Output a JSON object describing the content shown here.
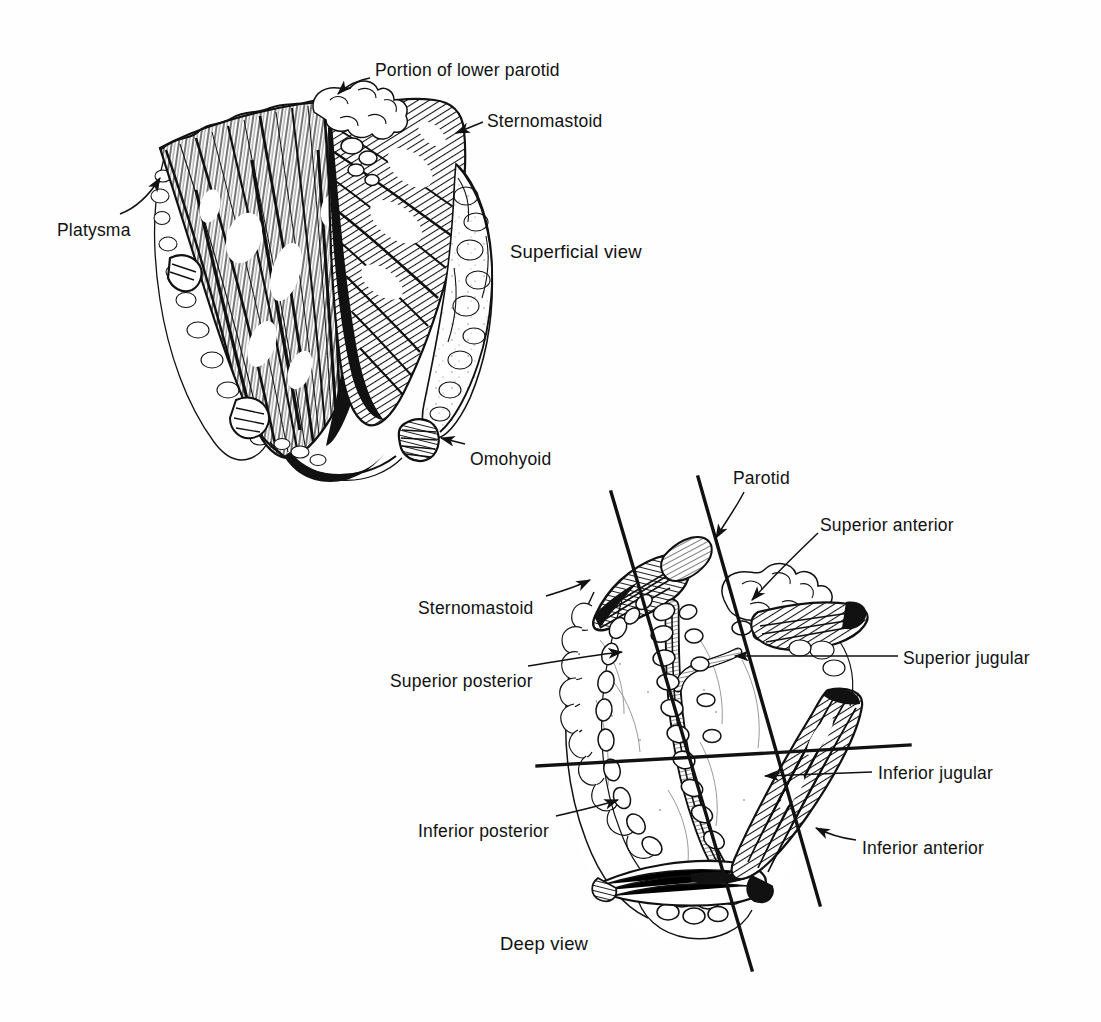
{
  "plate": {
    "background_color": "#ffffff",
    "ink_color": "#111111",
    "width": 1101,
    "height": 1022,
    "medium": "pen-and-ink line engraving",
    "subject": "Neck dissection: superficial and deep views with cervical lymph node groups"
  },
  "figures": [
    {
      "id": "superficial",
      "caption": "Superficial view",
      "caption_pos": {
        "x": 510,
        "y": 243
      },
      "labels": [
        {
          "id": "portion-of-lower-parotid",
          "text": "Portion of lower parotid",
          "x": 375,
          "y": 62,
          "leader": {
            "from": [
              370,
              78
            ],
            "to": [
              336,
              95
            ],
            "arrow": true,
            "curve": "concave-down"
          }
        },
        {
          "id": "sternomastoid-superficial",
          "text": "Sternomastoid",
          "x": 487,
          "y": 113,
          "leader": {
            "from": [
              482,
              124
            ],
            "to": [
              452,
              135
            ],
            "arrow": true,
            "curve": "straight"
          }
        },
        {
          "id": "platysma",
          "text": "Platysma",
          "x": 57,
          "y": 222,
          "leader": {
            "from": [
              118,
              214
            ],
            "to": [
              160,
              176
            ],
            "arrow": true,
            "curve": "concave-left"
          }
        },
        {
          "id": "omohyoid-superficial",
          "text": "Omohyoid",
          "x": 470,
          "y": 451,
          "leader": {
            "from": [
              463,
              444
            ],
            "to": [
              437,
              437
            ],
            "arrow": true,
            "curve": "straight"
          }
        }
      ]
    },
    {
      "id": "deep",
      "caption": "Deep view",
      "caption_pos": {
        "x": 500,
        "y": 935
      },
      "labels": [
        {
          "id": "parotid",
          "text": "Parotid",
          "x": 733,
          "y": 470,
          "leader": {
            "from": [
              740,
              488
            ],
            "to": [
              713,
              540
            ],
            "arrow": true,
            "curve": "concave-right"
          }
        },
        {
          "id": "superior-anterior",
          "text": "Superior anterior",
          "x": 820,
          "y": 517,
          "leader": {
            "from": [
              818,
              533
            ],
            "to": [
              748,
              604
            ],
            "arrow": true,
            "curve": "concave-up"
          }
        },
        {
          "id": "sternomastoid-deep",
          "text": "Sternomastoid",
          "x": 418,
          "y": 600,
          "leader": {
            "from": [
              545,
              596
            ],
            "to": [
              592,
              582
            ],
            "arrow": true,
            "curve": "concave-up"
          }
        },
        {
          "id": "superior-jugular",
          "text": "Superior jugular",
          "x": 903,
          "y": 650,
          "leader": {
            "from": [
              898,
              656
            ],
            "to": [
              730,
              656
            ],
            "arrow": true,
            "curve": "straight"
          }
        },
        {
          "id": "superior-posterior",
          "text": "Superior posterior",
          "x": 390,
          "y": 673,
          "leader": {
            "from": [
              528,
              665
            ],
            "to": [
              626,
              652
            ],
            "arrow": true,
            "curve": "concave-up"
          }
        },
        {
          "id": "inferior-jugular",
          "text": "Inferior jugular",
          "x": 878,
          "y": 765,
          "leader": {
            "from": [
              872,
              772
            ],
            "to": [
              760,
              775
            ],
            "arrow": true,
            "curve": "straight"
          }
        },
        {
          "id": "inferior-posterior",
          "text": "Inferior posterior",
          "x": 418,
          "y": 823,
          "leader": {
            "from": [
              556,
              815
            ],
            "to": [
              620,
              800
            ],
            "arrow": true,
            "curve": "concave-up"
          }
        },
        {
          "id": "inferior-anterior",
          "text": "Inferior anterior",
          "x": 862,
          "y": 840,
          "leader": {
            "from": [
              856,
              840
            ],
            "to": [
              812,
              828
            ],
            "arrow": true,
            "curve": "concave-up"
          }
        }
      ],
      "quadrant_lines": [
        {
          "id": "left-oblique-line",
          "from": [
            611,
            492
          ],
          "to": [
            752,
            970
          ],
          "width": 3.2
        },
        {
          "id": "right-oblique-line",
          "from": [
            698,
            477
          ],
          "to": [
            820,
            905
          ],
          "width": 3.2
        },
        {
          "id": "horizontal-line",
          "from": [
            537,
            766
          ],
          "to": [
            910,
            745
          ],
          "width": 3.2
        }
      ]
    }
  ]
}
